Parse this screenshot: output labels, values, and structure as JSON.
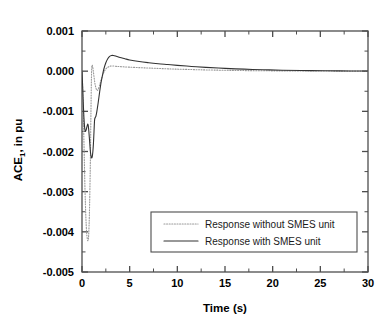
{
  "chart_data": {
    "type": "line",
    "title": "",
    "xlabel": "Time (s)",
    "ylabel": "ACE, in pu",
    "ylabel_subscript": "1",
    "xlim": [
      0,
      30
    ],
    "ylim": [
      -0.005,
      0.001
    ],
    "xticks": [
      0,
      5,
      10,
      15,
      20,
      25,
      30
    ],
    "xtick_labels": [
      "0",
      "5",
      "10",
      "15",
      "20",
      "25",
      "30"
    ],
    "yticks": [
      0.001,
      0.0,
      -0.001,
      -0.002,
      -0.003,
      -0.004,
      -0.005
    ],
    "ytick_labels": [
      "0.001",
      "0.000",
      "-0.001",
      "-0.002",
      "-0.003",
      "-0.004",
      "-0.005"
    ],
    "x_minor_step": 2.5,
    "y_minor_step": 0.0005,
    "grid": false,
    "legend_position": "lower-right",
    "frame_color": "#4d4d4d",
    "series": [
      {
        "name": "Response without SMES unit",
        "style": "dotted",
        "color": "#999999",
        "points": [
          [
            0.0,
            0.0
          ],
          [
            0.08,
            -0.00055
          ],
          [
            0.16,
            -0.0013
          ],
          [
            0.24,
            -0.00215
          ],
          [
            0.32,
            -0.003
          ],
          [
            0.4,
            -0.0036
          ],
          [
            0.48,
            -0.004
          ],
          [
            0.56,
            -0.00418
          ],
          [
            0.62,
            -0.00422
          ],
          [
            0.68,
            -0.00415
          ],
          [
            0.74,
            -0.00385
          ],
          [
            0.8,
            -0.0033
          ],
          [
            0.86,
            -0.0025
          ],
          [
            0.9,
            -0.0018
          ],
          [
            0.94,
            -0.001
          ],
          [
            0.98,
            -0.0003
          ],
          [
            1.02,
            8e-05
          ],
          [
            1.06,
            0.00015
          ],
          [
            1.1,
            0.00013
          ],
          [
            1.16,
            5e-05
          ],
          [
            1.24,
            -0.0001
          ],
          [
            1.34,
            -0.00028
          ],
          [
            1.46,
            -0.00042
          ],
          [
            1.58,
            -0.00048
          ],
          [
            1.7,
            -0.00045
          ],
          [
            1.85,
            -0.00035
          ],
          [
            2.0,
            -0.00022
          ],
          [
            2.2,
            -8e-05
          ],
          [
            2.4,
            2e-05
          ],
          [
            2.6,
            8e-05
          ],
          [
            2.9,
            0.00012
          ],
          [
            3.2,
            0.00013
          ],
          [
            3.6,
            0.00012
          ],
          [
            4.2,
            0.00011
          ],
          [
            5.0,
            0.0001
          ],
          [
            6.0,
            8.8e-05
          ],
          [
            7.0,
            7.8e-05
          ],
          [
            8.0,
            6.8e-05
          ],
          [
            9.0,
            5.8e-05
          ],
          [
            10.0,
            5e-05
          ],
          [
            11.5,
            4e-05
          ],
          [
            13.0,
            3.1e-05
          ],
          [
            15.0,
            2.2e-05
          ],
          [
            17.0,
            1.5e-05
          ],
          [
            19.0,
            1e-05
          ],
          [
            21.0,
            7e-06
          ],
          [
            24.0,
            4e-06
          ],
          [
            27.0,
            2e-06
          ],
          [
            30.0,
            1e-06
          ]
        ]
      },
      {
        "name": "Response with SMES unit",
        "style": "solid",
        "color": "#333333",
        "points": [
          [
            0.0,
            0.0
          ],
          [
            0.08,
            -0.00045
          ],
          [
            0.16,
            -0.00095
          ],
          [
            0.24,
            -0.0013
          ],
          [
            0.3,
            -0.00145
          ],
          [
            0.36,
            -0.0015
          ],
          [
            0.44,
            -0.00146
          ],
          [
            0.52,
            -0.00138
          ],
          [
            0.58,
            -0.00133
          ],
          [
            0.62,
            -0.00132
          ],
          [
            0.66,
            -0.00136
          ],
          [
            0.72,
            -0.0015
          ],
          [
            0.8,
            -0.00175
          ],
          [
            0.88,
            -0.002
          ],
          [
            0.96,
            -0.00213
          ],
          [
            1.02,
            -0.00216
          ],
          [
            1.08,
            -0.00212
          ],
          [
            1.14,
            -0.002
          ],
          [
            1.2,
            -0.0018
          ],
          [
            1.26,
            -0.0015
          ],
          [
            1.32,
            -0.00122
          ],
          [
            1.38,
            -0.00116
          ],
          [
            1.46,
            -0.00112
          ],
          [
            1.56,
            -0.001
          ],
          [
            1.7,
            -0.00078
          ],
          [
            1.85,
            -0.00052
          ],
          [
            2.0,
            -0.00028
          ],
          [
            2.15,
            -0.0001
          ],
          [
            2.3,
            6e-05
          ],
          [
            2.5,
            0.00021
          ],
          [
            2.7,
            0.00031
          ],
          [
            2.9,
            0.00037
          ],
          [
            3.1,
            0.00039
          ],
          [
            3.3,
            0.00039
          ],
          [
            3.6,
            0.00037
          ],
          [
            4.0,
            0.00034
          ],
          [
            4.5,
            0.00031
          ],
          [
            5.0,
            0.00028
          ],
          [
            6.0,
            0.00024
          ],
          [
            7.0,
            0.00021
          ],
          [
            8.0,
            0.000185
          ],
          [
            9.0,
            0.000165
          ],
          [
            10.0,
            0.000145
          ],
          [
            11.5,
            0.000118
          ],
          [
            13.0,
            9.5e-05
          ],
          [
            15.0,
            7e-05
          ],
          [
            17.0,
            5e-05
          ],
          [
            19.0,
            3.5e-05
          ],
          [
            21.0,
            2.4e-05
          ],
          [
            24.0,
            1.3e-05
          ],
          [
            27.0,
            7e-06
          ],
          [
            30.0,
            3e-06
          ]
        ]
      }
    ]
  }
}
